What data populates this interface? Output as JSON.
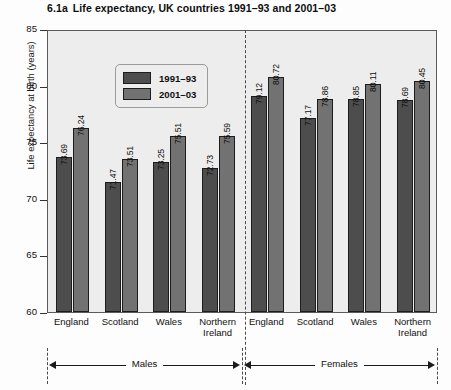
{
  "chart_data": {
    "type": "bar",
    "title_number": "6.1a",
    "title_text": "Life expectancy, UK countries 1991–93 and 2001–03",
    "xlabel": "",
    "ylabel": "Life expectancy at birth (years)",
    "ylim": [
      60,
      85
    ],
    "ytick_labels": [
      "85",
      "80",
      "75",
      "70",
      "65",
      "60"
    ],
    "yticks": [
      85,
      80,
      75,
      70,
      65,
      60
    ],
    "grid": false,
    "legend_position": "top-left inside plot",
    "categories": [
      "England",
      "Scotland",
      "Wales",
      "Northern Ireland",
      "England",
      "Scotland",
      "Wales",
      "Northern Ireland"
    ],
    "groups": [
      {
        "name": "Males",
        "categories": [
          "England",
          "Scotland",
          "Wales",
          "Northern Ireland"
        ]
      },
      {
        "name": "Females",
        "categories": [
          "England",
          "Scotland",
          "Wales",
          "Northern Ireland"
        ]
      }
    ],
    "series": [
      {
        "name": "1991–93",
        "color": "#4d4d4d",
        "values": [
          73.69,
          71.47,
          73.25,
          72.73,
          79.12,
          77.17,
          78.85,
          78.69
        ]
      },
      {
        "name": "2001–03",
        "color": "#727272",
        "values": [
          76.24,
          73.51,
          75.51,
          75.59,
          80.72,
          78.86,
          80.11,
          80.45
        ]
      }
    ],
    "data_labels": [
      "73.69",
      "76.24",
      "71.47",
      "73.51",
      "73.25",
      "75.51",
      "72.73",
      "75.59",
      "79.12",
      "80.72",
      "77.17",
      "78.86",
      "78.85",
      "80.11",
      "78.69",
      "80.45"
    ],
    "legend": [
      {
        "label": "1991–93",
        "color": "#4d4d4d"
      },
      {
        "label": "2001–03",
        "color": "#727272"
      }
    ],
    "annotations": [
      {
        "text": "Males",
        "type": "bracket"
      },
      {
        "text": "Females",
        "type": "bracket"
      }
    ]
  },
  "colors": {
    "series_1991_93": "#4d4d4d",
    "series_2001_03": "#727272",
    "plot_background": "#ededed",
    "axis": "#5a5a5a",
    "text": "#111111"
  }
}
